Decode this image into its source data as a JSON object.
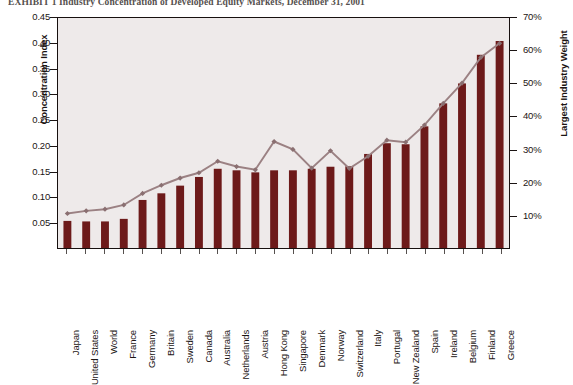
{
  "title": "EXHIBIT 1  Industry Concentration of Developed Equity Markets, December 31, 2001",
  "axes": {
    "left_title": "Concentration Index",
    "right_title": "Largest Industry Weight",
    "left_ticks": [
      "0.45",
      "0.40",
      "0.35",
      "0.30",
      "0.25",
      "0.20",
      "0.15",
      "0.10",
      "0.05"
    ],
    "right_ticks": [
      "70%",
      "60%",
      "50%",
      "40%",
      "30%",
      "20%",
      "10%"
    ]
  },
  "colors": {
    "bar": "#6d1a1a",
    "line": "#9b8183",
    "marker": "#8a6f71",
    "plot_bg": "#eeeaea",
    "frame": "#17100f",
    "text": "#1b1413"
  },
  "chart_data": {
    "type": "bar",
    "title": "EXHIBIT 1  Industry Concentration of Developed Equity Markets, December 31, 2001",
    "xlabel": "",
    "ylabel": "Concentration Index",
    "y2label": "Largest Industry Weight",
    "ylim": [
      0,
      0.45
    ],
    "y2lim": [
      0,
      0.7
    ],
    "grid": false,
    "legend": "none",
    "categories": [
      "Japan",
      "United States",
      "World",
      "France",
      "Germany",
      "Britain",
      "Sweden",
      "Canada",
      "Australia",
      "Netherlands",
      "Austria",
      "Hong Kong",
      "Singapore",
      "Denmark",
      "Norway",
      "Switzerland",
      "Italy",
      "Portugal",
      "New Zealand",
      "Spain",
      "Ireland",
      "Belgium",
      "Finland",
      "Greece"
    ],
    "series": [
      {
        "name": "Concentration Index",
        "type": "bar",
        "axis": "left",
        "values": [
          0.053,
          0.052,
          0.052,
          0.057,
          0.094,
          0.107,
          0.122,
          0.139,
          0.155,
          0.152,
          0.148,
          0.152,
          0.152,
          0.155,
          0.159,
          0.16,
          0.184,
          0.205,
          0.203,
          0.238,
          0.283,
          0.322,
          0.378,
          0.405
        ]
      },
      {
        "name": "Largest Industry Weight",
        "type": "line",
        "axis": "right",
        "values": [
          0.105,
          0.113,
          0.118,
          0.131,
          0.166,
          0.191,
          0.213,
          0.229,
          0.264,
          0.248,
          0.238,
          0.324,
          0.3,
          0.243,
          0.296,
          0.242,
          0.279,
          0.328,
          0.322,
          0.374,
          0.44,
          0.502,
          0.58,
          0.623
        ]
      }
    ]
  }
}
